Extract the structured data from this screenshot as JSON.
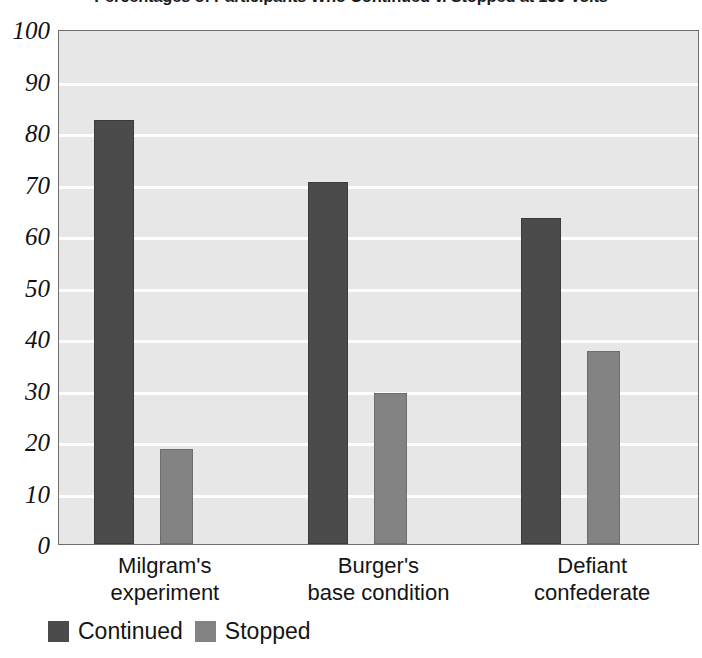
{
  "chart_data": {
    "type": "bar",
    "title": "Percentages of Participants Who Continued v. Stopped at 150 Volts",
    "xlabel": "",
    "ylabel": "",
    "ylim": [
      0,
      100
    ],
    "yticks": [
      100,
      90,
      80,
      70,
      60,
      50,
      40,
      30,
      20,
      10,
      0
    ],
    "grid": true,
    "legend_position": "bottom-left",
    "categories": [
      "Milgram's experiment",
      "Burger's base condition",
      "Defiant confederate"
    ],
    "category_lines": [
      [
        "Milgram's",
        "experiment"
      ],
      [
        "Burger's",
        "base condition"
      ],
      [
        "Defiant",
        "confederate"
      ]
    ],
    "series": [
      {
        "name": "Continued",
        "color": "#4b4b4b",
        "values": [
          82,
          70,
          63
        ]
      },
      {
        "name": "Stopped",
        "color": "#838383",
        "values": [
          18,
          29,
          37
        ]
      }
    ]
  },
  "legend": {
    "items": [
      {
        "label": "Continued",
        "swatch": "continued"
      },
      {
        "label": "Stopped",
        "swatch": "stopped"
      }
    ]
  },
  "colors": {
    "continued": "#4b4b4b",
    "stopped": "#838383",
    "plot_background": "#e7e7e7",
    "gridline": "#ffffff",
    "plot_border": "#6e6e6e",
    "text": "#141414"
  }
}
